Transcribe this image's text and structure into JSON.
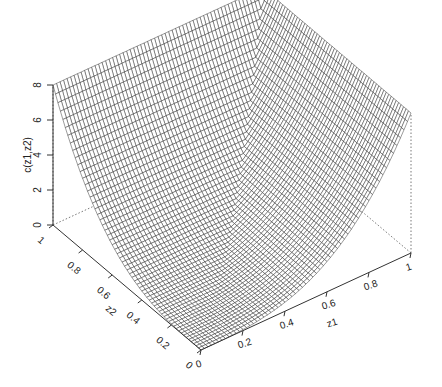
{
  "chart_data": {
    "type": "surface3d",
    "title": "",
    "xlabel": "z1",
    "ylabel": "z2",
    "zlabel": "c(z1,z2)",
    "xlim": [
      0,
      1
    ],
    "ylim": [
      0,
      1
    ],
    "zlim": [
      0,
      8
    ],
    "x_ticks": [
      "0",
      "0.2",
      "0.4",
      "0.6",
      "0.8",
      "1"
    ],
    "y_ticks": [
      "0",
      "0.2",
      "0.4",
      "0.6",
      "0.8",
      "1"
    ],
    "z_ticks": [
      "0",
      "2",
      "4",
      "6",
      "8"
    ],
    "grid_resolution": 60,
    "surface_description": "Wireframe perspective surface; value 0 at (0,0), rising convexly to 8 along edges z1=1 and z2=1, with a crease along the diagonal z1=z2",
    "corner_values": {
      "z1=0,z2=0": 0,
      "z1=1,z2=0": 8,
      "z1=0,z2=1": 8,
      "z1=1,z2=1": 8
    },
    "projection": {
      "front": [
        201,
        350
      ],
      "x_end": [
        411,
        253
      ],
      "y_end": [
        53,
        225
      ],
      "z_height_px": 140
    }
  },
  "axes": {
    "z_label": "c(z1,z2)",
    "x_label": "z1",
    "y_label": "z2"
  }
}
